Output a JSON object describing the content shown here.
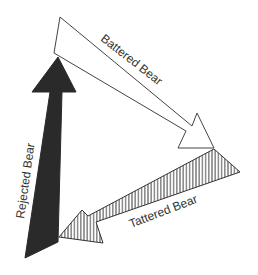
{
  "diagram": {
    "arrows": [
      {
        "id": "battered",
        "label": "Battered Bear",
        "style": "outline",
        "fill": "#ffffff",
        "stroke": "#444444"
      },
      {
        "id": "tattered",
        "label": "Tattered Bear",
        "style": "hatched",
        "fill": "#ffffff",
        "stroke": "#333333"
      },
      {
        "id": "rejected",
        "label": "Rejected Bear",
        "style": "solid",
        "fill": "#2a2a2a",
        "stroke": "#2a2a2a"
      }
    ]
  }
}
